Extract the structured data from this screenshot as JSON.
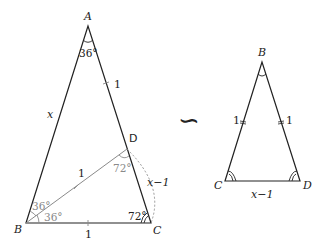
{
  "diagram": {
    "left_triangle": {
      "vertices": {
        "A": {
          "label": "A",
          "x": 88,
          "y": 26
        },
        "B": {
          "label": "B",
          "x": 26,
          "y": 223
        },
        "C": {
          "label": "C",
          "x": 151,
          "y": 223
        },
        "D": {
          "label": "D",
          "x": 127,
          "y": 149
        }
      },
      "side_labels": {
        "AB": "x",
        "AD": "1",
        "BD": "1",
        "BC": "1",
        "DC": "x−1"
      },
      "angle_labels": {
        "A": "36°",
        "B_upper": "36°",
        "B_lower": "36°",
        "D": "72°",
        "C": "72°"
      }
    },
    "similarity_symbol": "∽",
    "right_triangle": {
      "vertices": {
        "B": {
          "label": "B",
          "x": 262,
          "y": 62
        },
        "C": {
          "label": "C",
          "x": 225,
          "y": 181
        },
        "D": {
          "label": "D",
          "x": 300,
          "y": 181
        }
      },
      "side_labels": {
        "BC": "1",
        "BD": "1",
        "CD": "x−1"
      }
    },
    "colors": {
      "line": "#222222",
      "auxiliary": "#8a8a8a"
    }
  }
}
